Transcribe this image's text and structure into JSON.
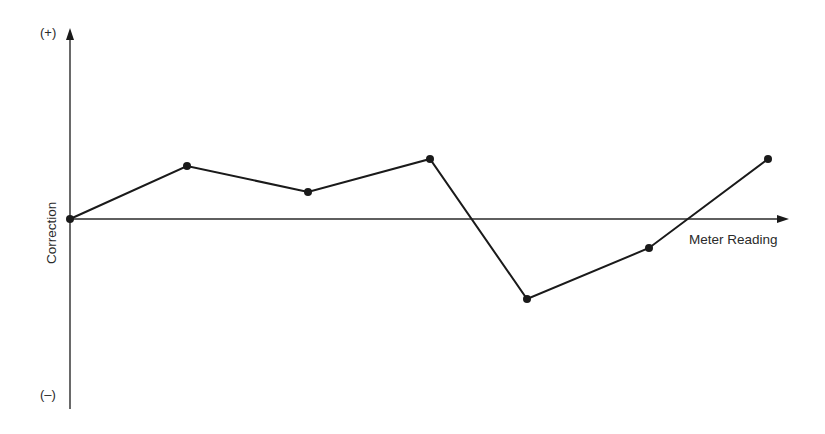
{
  "chart_data": {
    "type": "line",
    "title": "",
    "xlabel": "Meter Reading",
    "ylabel": "Correction",
    "y_top_label": "(+)",
    "y_bottom_label": "(–)",
    "grid": false,
    "legend": null,
    "x": [
      0,
      1,
      2,
      3,
      4,
      5,
      6
    ],
    "values": [
      0,
      0.53,
      0.29,
      0.6,
      -0.83,
      -0.3,
      0.6
    ],
    "ylim": [
      -2,
      2
    ],
    "points_px": [
      [
        70,
        219
      ],
      [
        187,
        166
      ],
      [
        308,
        192
      ],
      [
        430,
        159
      ],
      [
        527,
        299
      ],
      [
        649,
        248
      ],
      [
        768,
        159
      ]
    ],
    "axes": {
      "origin_px": [
        70,
        219
      ],
      "x_axis_end_px": 788,
      "y_axis_top_px": 30,
      "y_axis_bottom_px": 409
    },
    "colors": {
      "line": "#1a1a1a",
      "axis": "#2a2a2a",
      "text": "#2a2a2a"
    }
  }
}
